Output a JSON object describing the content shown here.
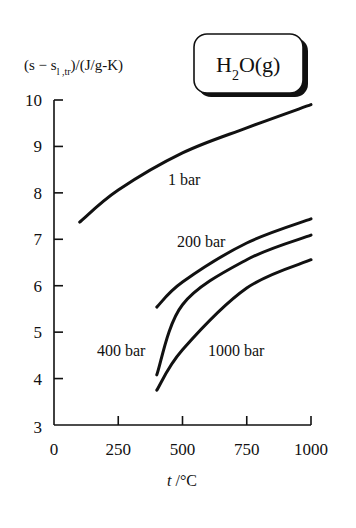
{
  "chart_data": {
    "type": "line",
    "title": "",
    "substance_badge": {
      "main": "H",
      "subscript": "2",
      "rest": "O(g)"
    },
    "ylabel": {
      "prefix": "(s − s",
      "subscript": "l ,tr",
      "suffix": ")/(J/g-K)"
    },
    "xlabel": {
      "var": "t",
      "unit": " /°C"
    },
    "xlim": [
      0,
      1000
    ],
    "ylim": [
      3,
      10
    ],
    "xticks": [
      0,
      250,
      500,
      750,
      1000
    ],
    "yticks": [
      3,
      4,
      5,
      6,
      7,
      8,
      9,
      10
    ],
    "grid": false,
    "legend": "inline labels",
    "series": [
      {
        "name": "1 bar",
        "x": [
          100,
          250,
          500,
          750,
          1000
        ],
        "y": [
          7.37,
          8.06,
          8.86,
          9.4,
          9.9
        ],
        "label_pos": [
          168,
          185
        ]
      },
      {
        "name": "200 bar",
        "x": [
          400,
          500,
          750,
          1000
        ],
        "y": [
          5.54,
          6.08,
          6.92,
          7.44
        ],
        "label_pos": [
          177,
          247
        ]
      },
      {
        "name": "400 bar",
        "x": [
          400,
          500,
          750,
          1000
        ],
        "y": [
          4.08,
          5.59,
          6.56,
          7.09
        ],
        "label_pos": [
          97,
          356
        ]
      },
      {
        "name": "1000 bar",
        "x": [
          400,
          500,
          750,
          1000
        ],
        "y": [
          3.75,
          4.62,
          5.95,
          6.56
        ],
        "label_pos": [
          208,
          356
        ]
      }
    ],
    "colors": {
      "line": "#111111",
      "background": "#ffffff"
    }
  }
}
